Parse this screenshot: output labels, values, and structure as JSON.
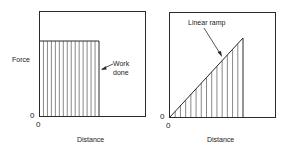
{
  "colors": {
    "stroke": "#2a2a2a",
    "hatch": "#555555",
    "background": "#ffffff"
  },
  "panels": [
    {
      "id": "constant-force",
      "ylabel": "Force",
      "xlabel": "Distance",
      "x_origin_label": "0",
      "y_origin_label": "0",
      "annotation_line1": "Work",
      "annotation_line2": "done",
      "shape": "rectangle",
      "hatch_lines": 15
    },
    {
      "id": "linear-ramp",
      "xlabel": "Distance",
      "x_origin_label": "0",
      "y_origin_label": "0",
      "annotation": "Linear ramp",
      "shape": "triangle",
      "hatch_lines": 14
    }
  ]
}
